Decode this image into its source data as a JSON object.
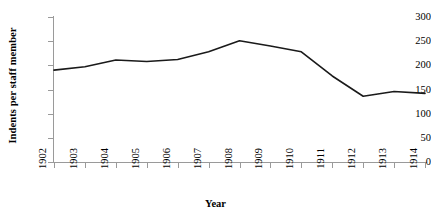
{
  "chart_data": {
    "type": "line",
    "title": "",
    "xlabel": "Year",
    "ylabel": "Indents per staff member",
    "categories": [
      "1902",
      "1903",
      "1904",
      "1905",
      "1906",
      "1907",
      "1908",
      "1909",
      "1910",
      "1911",
      "1912",
      "1913",
      "1914"
    ],
    "values": [
      190,
      197,
      211,
      208,
      212,
      228,
      251,
      240,
      228,
      178,
      136,
      146,
      142
    ],
    "series": [
      {
        "name": "Indents per staff member",
        "values": [
          190,
          197,
          211,
          208,
          212,
          228,
          251,
          240,
          228,
          178,
          136,
          146,
          142
        ]
      }
    ],
    "ylim": [
      0,
      300
    ],
    "y_ticks": [
      0,
      50,
      100,
      150,
      200,
      250,
      300
    ],
    "y_tick_labels": [
      "0",
      "50",
      "100",
      "150",
      "200",
      "250",
      "300"
    ],
    "x_tick_labels": [
      "1902",
      "1903",
      "1904",
      "1905",
      "1906",
      "1907",
      "1908",
      "1909",
      "1910",
      "1911",
      "1912",
      "1913",
      "1914"
    ],
    "grid": false,
    "legend": false,
    "legend_position": "none",
    "line_color": "#1a1a1a",
    "axis_color": "#9a9a9a",
    "background_color": "#ffffff",
    "markers": false
  },
  "axes": {
    "y_title": "Indents per staff member",
    "x_title": "Year"
  }
}
